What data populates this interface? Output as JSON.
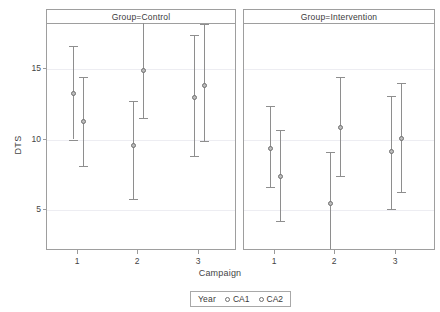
{
  "chart_data": {
    "type": "scatter",
    "title": "",
    "xlabel": "Campaign",
    "ylabel": "DTS",
    "categories": [
      "1",
      "2",
      "3"
    ],
    "ylim": [
      1.6,
      19.0
    ],
    "yticks": [
      5,
      10,
      15
    ],
    "ytick_labels": [
      "5",
      "10",
      "15"
    ],
    "grid": true,
    "legend_position": "bottom",
    "legend_title": "Year",
    "panels": [
      {
        "label": "Group=Control",
        "series": [
          {
            "name": "CA1",
            "points": [
              {
                "x": "1",
                "value": 13.3,
                "low": 10.0,
                "high": 16.6
              },
              {
                "x": "2",
                "value": 9.6,
                "low": 5.8,
                "high": 12.7
              },
              {
                "x": "3",
                "value": 13.0,
                "low": 8.8,
                "high": 17.4
              }
            ]
          },
          {
            "name": "CA2",
            "points": [
              {
                "x": "1",
                "value": 11.3,
                "low": 8.1,
                "high": 14.4
              },
              {
                "x": "2",
                "value": 14.9,
                "low": 11.5,
                "high": 18.5
              },
              {
                "x": "3",
                "value": 13.9,
                "low": 9.9,
                "high": 18.2
              }
            ]
          }
        ]
      },
      {
        "label": "Group=Intervention",
        "series": [
          {
            "name": "CA1",
            "points": [
              {
                "x": "1",
                "value": 9.4,
                "low": 6.6,
                "high": 12.4
              },
              {
                "x": "2",
                "value": 5.5,
                "low": 1.9,
                "high": 9.1
              },
              {
                "x": "3",
                "value": 9.2,
                "low": 5.1,
                "high": 13.1
              }
            ]
          },
          {
            "name": "CA2",
            "points": [
              {
                "x": "1",
                "value": 7.4,
                "low": 4.2,
                "high": 10.7
              },
              {
                "x": "2",
                "value": 10.9,
                "low": 7.4,
                "high": 14.4
              },
              {
                "x": "3",
                "value": 10.1,
                "low": 6.3,
                "high": 14.0
              }
            ]
          }
        ]
      }
    ]
  },
  "legend": {
    "title": "Year",
    "items": [
      {
        "label": "CA1",
        "marker": "open-circle-icon"
      },
      {
        "label": "CA2",
        "marker": "open-circle-icon"
      }
    ]
  },
  "axes": {
    "y_title": "DTS",
    "x_title": "Campaign"
  }
}
